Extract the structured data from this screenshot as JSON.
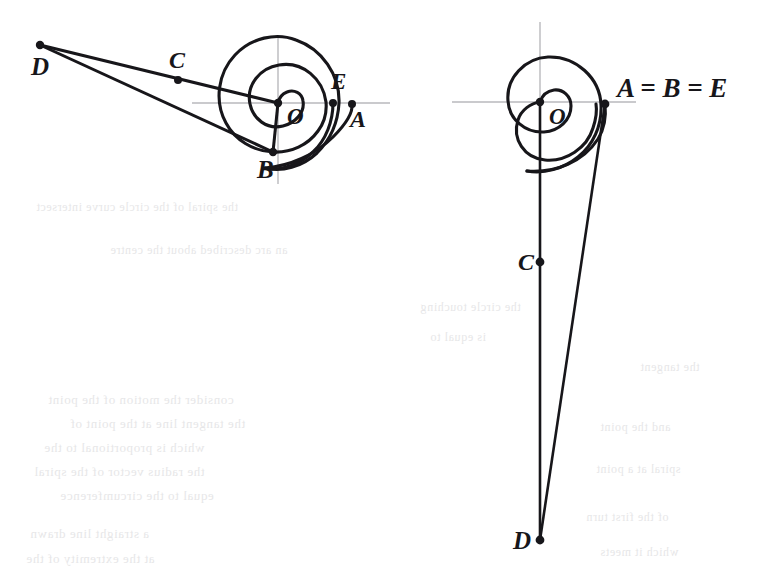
{
  "page": {
    "background": "#ffffff",
    "width": 780,
    "height": 577,
    "ink_color": "#17161a",
    "axis_color": "#b9b9bd",
    "ghost_color": "#cfcfd2"
  },
  "figures": [
    {
      "id": "left-figure",
      "name": "left-spiral-diagram",
      "center": {
        "x": 278,
        "y": 103
      },
      "axes": {
        "horizontal": {
          "x1": 192,
          "y1": 103,
          "x2": 390,
          "y2": 103
        },
        "vertical": {
          "x1": 278,
          "y1": 38,
          "x2": 278,
          "y2": 184
        }
      },
      "points": [
        {
          "key": "D",
          "label": "D",
          "x": 40,
          "y": 45,
          "label_x": 31,
          "label_y": 75,
          "dot": true
        },
        {
          "key": "C",
          "label": "C",
          "x": 178,
          "y": 80,
          "label_x": 169,
          "label_y": 68,
          "dot": true
        },
        {
          "key": "O",
          "label": "O",
          "x": 278,
          "y": 103,
          "label_x": 287,
          "label_y": 124,
          "dot": true
        },
        {
          "key": "B",
          "label": "B",
          "x": 273,
          "y": 152,
          "label_x": 257,
          "label_y": 178,
          "dot": true
        },
        {
          "key": "E",
          "label": "E",
          "x": 333,
          "y": 103,
          "label_x": 331,
          "label_y": 89,
          "dot": true
        },
        {
          "key": "A",
          "label": "A",
          "x": 352,
          "y": 104,
          "label_x": 350,
          "label_y": 127,
          "dot": true
        }
      ],
      "segments": [
        {
          "name": "segment-D-to-O",
          "from": "D",
          "to": "O"
        },
        {
          "name": "segment-D-to-B",
          "from": "D",
          "to": "B"
        },
        {
          "name": "segment-O-to-B",
          "from": "O",
          "to": "B"
        }
      ]
    },
    {
      "id": "right-figure",
      "name": "right-spiral-diagram",
      "center": {
        "x": 540,
        "y": 102
      },
      "axes": {
        "horizontal": {
          "x1": 452,
          "y1": 102,
          "x2": 636,
          "y2": 102
        },
        "vertical": {
          "x1": 540,
          "y1": 22,
          "x2": 540,
          "y2": 195
        }
      },
      "points": [
        {
          "key": "O",
          "label": "O",
          "x": 540,
          "y": 102,
          "label_x": 549,
          "label_y": 124,
          "dot": true
        },
        {
          "key": "ABE",
          "label": "A = B = E",
          "x": 605,
          "y": 104,
          "label_x": 617,
          "label_y": 97,
          "dot": true
        },
        {
          "key": "C",
          "label": "C",
          "x": 540,
          "y": 262,
          "label_x": 518,
          "label_y": 270,
          "dot": true
        },
        {
          "key": "D",
          "label": "D",
          "x": 540,
          "y": 540,
          "label_x": 513,
          "label_y": 549,
          "dot": true
        }
      ],
      "segments": [
        {
          "name": "segment-O-to-D-vertical",
          "from": "O",
          "to": "D"
        },
        {
          "name": "segment-ABE-to-D",
          "from": "ABE",
          "to": "D"
        }
      ]
    }
  ],
  "ghost_lines": [
    {
      "text": "the spiral of the circle curve intersect",
      "x": 36,
      "y": 200,
      "size": 12
    },
    {
      "text": "an arc described about the centre",
      "x": 110,
      "y": 243,
      "size": 12
    },
    {
      "text": "consider the motion of the point",
      "x": 48,
      "y": 392,
      "size": 13
    },
    {
      "text": "the tangent line at the point of",
      "x": 70,
      "y": 416,
      "size": 13
    },
    {
      "text": "which is proportional to the",
      "x": 44,
      "y": 440,
      "size": 13
    },
    {
      "text": "the radius vector of the spiral",
      "x": 34,
      "y": 464,
      "size": 13
    },
    {
      "text": "equal to the circumference",
      "x": 60,
      "y": 488,
      "size": 13
    },
    {
      "text": "a straight line drawn",
      "x": 30,
      "y": 526,
      "size": 13
    },
    {
      "text": "at the extremity of the",
      "x": 26,
      "y": 551,
      "size": 13
    },
    {
      "text": "the circle touching",
      "x": 420,
      "y": 300,
      "size": 12
    },
    {
      "text": "is equal to",
      "x": 430,
      "y": 330,
      "size": 12
    },
    {
      "text": "the tangent",
      "x": 640,
      "y": 360,
      "size": 12
    },
    {
      "text": "and the point",
      "x": 600,
      "y": 420,
      "size": 12
    },
    {
      "text": "spiral at a point",
      "x": 596,
      "y": 462,
      "size": 12
    },
    {
      "text": "of the first turn",
      "x": 586,
      "y": 510,
      "size": 12
    },
    {
      "text": "which it meets",
      "x": 600,
      "y": 545,
      "size": 12
    }
  ]
}
